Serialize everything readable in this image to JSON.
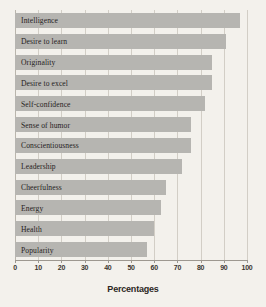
{
  "chart_data": {
    "type": "bar",
    "orientation": "horizontal",
    "title": "",
    "xlabel": "Percentages",
    "ylabel": "",
    "xlim": [
      0,
      100
    ],
    "grid": true,
    "legend": null,
    "xticks": [
      0,
      10,
      20,
      30,
      40,
      50,
      60,
      70,
      80,
      90,
      100
    ],
    "categories": [
      "Intelligence",
      "Desire to learn",
      "Originality",
      "Desire to excel",
      "Self-confidence",
      "Sense of humor",
      "Conscientiousness",
      "Leadership",
      "Cheerfulness",
      "Energy",
      "Health",
      "Popularity"
    ],
    "values": [
      97,
      91,
      85,
      85,
      82,
      76,
      76,
      72,
      65,
      63,
      60,
      57
    ],
    "bar_color": "#b6b5b1",
    "background_color": "#f3f1ec",
    "gridline_color": "#d2cec6"
  }
}
